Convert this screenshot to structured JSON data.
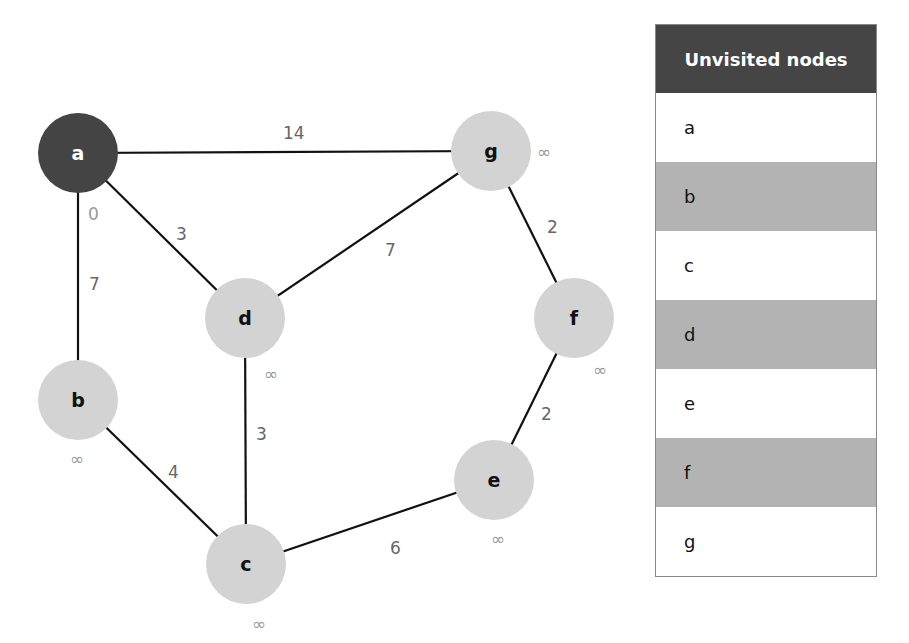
{
  "table": {
    "header": "Unvisited nodes",
    "rows": [
      "a",
      "b",
      "c",
      "d",
      "e",
      "f",
      "g"
    ]
  },
  "colors": {
    "visited": "#444444",
    "unvisited": "#d3d3d3",
    "edge": "#111111"
  },
  "nodes": [
    {
      "id": "a",
      "x": 78,
      "y": 153,
      "distance": "0",
      "current": true
    },
    {
      "id": "b",
      "x": 78,
      "y": 400,
      "distance": "∞"
    },
    {
      "id": "c",
      "x": 246,
      "y": 564,
      "distance": "∞"
    },
    {
      "id": "d",
      "x": 245,
      "y": 318,
      "distance": "∞"
    },
    {
      "id": "e",
      "x": 494,
      "y": 480,
      "distance": "∞"
    },
    {
      "id": "f",
      "x": 574,
      "y": 318,
      "distance": "∞"
    },
    {
      "id": "g",
      "x": 491,
      "y": 151,
      "distance": "∞"
    }
  ],
  "edges": [
    {
      "from": "a",
      "to": "g",
      "weight": "14"
    },
    {
      "from": "a",
      "to": "d",
      "weight": "3"
    },
    {
      "from": "a",
      "to": "b",
      "weight": "7"
    },
    {
      "from": "d",
      "to": "g",
      "weight": "7"
    },
    {
      "from": "g",
      "to": "f",
      "weight": "2"
    },
    {
      "from": "d",
      "to": "c",
      "weight": "3"
    },
    {
      "from": "b",
      "to": "c",
      "weight": "4"
    },
    {
      "from": "c",
      "to": "e",
      "weight": "6"
    },
    {
      "from": "f",
      "to": "e",
      "weight": "2"
    }
  ]
}
